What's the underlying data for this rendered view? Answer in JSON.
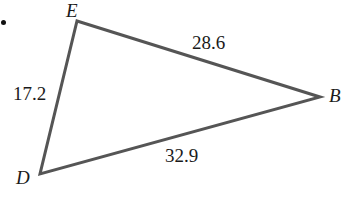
{
  "figure": {
    "type": "triangle-diagram",
    "background_color": "#ffffff",
    "stroke_color": "#555555",
    "text_color": "#1a1a1a",
    "bullet": {
      "name": "bullet-dot",
      "visible": true
    },
    "vertices": [
      {
        "id": "E",
        "label": "E",
        "x": 77,
        "y": 21,
        "label_x": 66,
        "label_y": 1
      },
      {
        "id": "B",
        "label": "B",
        "x": 320,
        "y": 97,
        "label_x": 329,
        "label_y": 86
      },
      {
        "id": "D",
        "label": "D",
        "x": 40,
        "y": 174,
        "label_x": 16,
        "label_y": 168
      }
    ],
    "sides": [
      {
        "id": "EB",
        "from": "E",
        "to": "B",
        "label": "28.6",
        "label_x": 192,
        "label_y": 33
      },
      {
        "id": "DE",
        "from": "D",
        "to": "E",
        "label": "17.2",
        "label_x": 13,
        "label_y": 84
      },
      {
        "id": "DB",
        "from": "D",
        "to": "B",
        "label": "32.9",
        "label_x": 165,
        "label_y": 146
      }
    ]
  }
}
